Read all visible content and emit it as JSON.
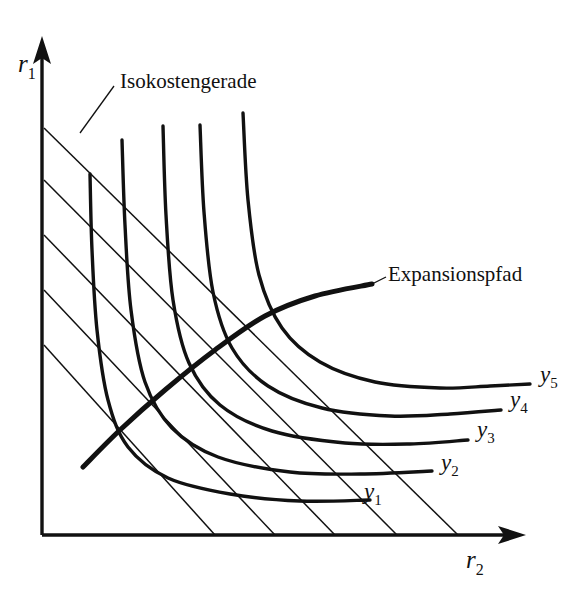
{
  "figure": {
    "type": "economics-diagram",
    "background_color": "#ffffff",
    "ink_color": "#111111",
    "axes": {
      "y_axis_label": "r",
      "y_axis_subscript": "1",
      "x_axis_label": "r",
      "x_axis_subscript": "2",
      "origin_px": [
        42,
        535
      ],
      "y_axis_top_px": [
        42,
        42
      ],
      "x_axis_right_px": [
        520,
        535
      ]
    },
    "annotations": [
      {
        "name": "isocost-annotation",
        "text": "Isokostengerade",
        "text_px": [
          120,
          88
        ],
        "leader_from_px": [
          80,
          133
        ],
        "leader_to_px": [
          114,
          86
        ]
      },
      {
        "name": "expansion-path-annotation",
        "text": "Expansionspfad",
        "text_px": [
          388,
          281
        ],
        "leader_from_px": [
          372,
          284
        ],
        "leader_to_px": [
          386,
          277
        ]
      }
    ],
    "isoquant_labels": [
      {
        "label": "y",
        "subscript": "1",
        "x_px": 364,
        "y_px": 499
      },
      {
        "label": "y",
        "subscript": "2",
        "x_px": 441,
        "y_px": 470
      },
      {
        "label": "y",
        "subscript": "3",
        "x_px": 477,
        "y_px": 437
      },
      {
        "label": "y",
        "subscript": "4",
        "x_px": 510,
        "y_px": 407
      },
      {
        "label": "y",
        "subscript": "5",
        "x_px": 540,
        "y_px": 382
      }
    ],
    "legend_description": {
      "isoquant_stroke": "thick",
      "isocost_stroke": "thin",
      "expansion_path_stroke": "thickest"
    }
  },
  "chart_data": {
    "type": "line",
    "title": "",
    "subtitle": "",
    "xlabel": "r2",
    "ylabel": "r1",
    "grid": false,
    "legend_position": "inline-right",
    "axis_ranges": {
      "x": [
        0,
        1
      ],
      "y": [
        0,
        1
      ]
    },
    "series": [
      {
        "name": "y1",
        "kind": "isoquant",
        "points_px": [
          [
            90,
            174
          ],
          [
            92,
            250
          ],
          [
            97,
            330
          ],
          [
            108,
            400
          ],
          [
            128,
            447
          ],
          [
            168,
            478
          ],
          [
            230,
            494
          ],
          [
            300,
            501
          ],
          [
            370,
            500
          ]
        ]
      },
      {
        "name": "y2",
        "kind": "isoquant",
        "points_px": [
          [
            122,
            140
          ],
          [
            125,
            225
          ],
          [
            131,
            310
          ],
          [
            145,
            382
          ],
          [
            172,
            428
          ],
          [
            218,
            457
          ],
          [
            290,
            472
          ],
          [
            360,
            474
          ],
          [
            432,
            471
          ]
        ]
      },
      {
        "name": "y3",
        "kind": "isoquant",
        "points_px": [
          [
            163,
            126
          ],
          [
            166,
            215
          ],
          [
            173,
            300
          ],
          [
            189,
            363
          ],
          [
            220,
            405
          ],
          [
            272,
            431
          ],
          [
            345,
            443
          ],
          [
            410,
            444
          ],
          [
            468,
            440
          ]
        ]
      },
      {
        "name": "y4",
        "kind": "isoquant",
        "points_px": [
          [
            200,
            125
          ],
          [
            204,
            212
          ],
          [
            213,
            292
          ],
          [
            232,
            348
          ],
          [
            268,
            386
          ],
          [
            322,
            408
          ],
          [
            390,
            416
          ],
          [
            450,
            414
          ],
          [
            501,
            410
          ]
        ]
      },
      {
        "name": "y5",
        "kind": "isoquant",
        "points_px": [
          [
            243,
            113
          ],
          [
            248,
            200
          ],
          [
            259,
            275
          ],
          [
            282,
            328
          ],
          [
            320,
            362
          ],
          [
            375,
            382
          ],
          [
            440,
            388
          ],
          [
            490,
            386
          ],
          [
            530,
            384
          ]
        ]
      },
      {
        "name": "isocost-1",
        "kind": "isocost",
        "points_px": [
          [
            44,
            345
          ],
          [
            215,
            535
          ]
        ]
      },
      {
        "name": "isocost-2",
        "kind": "isocost",
        "points_px": [
          [
            44,
            290
          ],
          [
            275,
            535
          ]
        ]
      },
      {
        "name": "isocost-3",
        "kind": "isocost",
        "points_px": [
          [
            44,
            235
          ],
          [
            335,
            535
          ]
        ]
      },
      {
        "name": "isocost-4",
        "kind": "isocost",
        "points_px": [
          [
            44,
            180
          ],
          [
            397,
            535
          ]
        ]
      },
      {
        "name": "isocost-5",
        "kind": "isocost",
        "points_px": [
          [
            44,
            128
          ],
          [
            458,
            535
          ]
        ]
      },
      {
        "name": "Expansionspfad",
        "kind": "expansion-path",
        "points_px": [
          [
            83,
            467
          ],
          [
            120,
            430
          ],
          [
            165,
            390
          ],
          [
            215,
            350
          ],
          [
            265,
            316
          ],
          [
            315,
            296
          ],
          [
            372,
            284
          ]
        ]
      }
    ]
  }
}
